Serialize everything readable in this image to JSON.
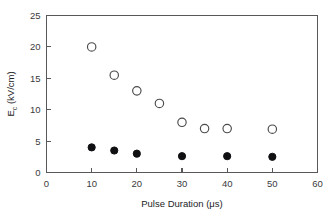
{
  "chart_data": {
    "type": "scatter",
    "title": "",
    "xlabel": "Pulse Duration (μs)",
    "ylabel": "E_c (kV/cm)",
    "ylabel_base": "E",
    "ylabel_subscript": "c",
    "ylabel_units": " (kV/cm)",
    "xlim": [
      0,
      60
    ],
    "ylim": [
      0,
      25
    ],
    "xticks": [
      0,
      10,
      20,
      30,
      40,
      50,
      60
    ],
    "yticks": [
      0,
      5,
      10,
      15,
      20,
      25
    ],
    "xtick_labels": [
      "0",
      "10",
      "20",
      "30",
      "40",
      "50",
      "60"
    ],
    "ytick_labels": [
      "0",
      "5",
      "10",
      "15",
      "20",
      "25"
    ],
    "grid": false,
    "legend": "none",
    "frame": "full-box",
    "series": [
      {
        "name": "open-circles",
        "marker": "open-circle",
        "color": "#4a4a4c",
        "x": [
          10,
          15,
          20,
          25,
          30,
          35,
          40,
          50
        ],
        "y": [
          20.0,
          15.5,
          13.0,
          11.0,
          8.0,
          7.0,
          7.0,
          6.9
        ]
      },
      {
        "name": "filled-circles",
        "marker": "filled-circle",
        "color": "#101012",
        "x": [
          10,
          15,
          20,
          30,
          40,
          50
        ],
        "y": [
          4.0,
          3.5,
          3.0,
          2.6,
          2.6,
          2.5
        ]
      }
    ]
  }
}
